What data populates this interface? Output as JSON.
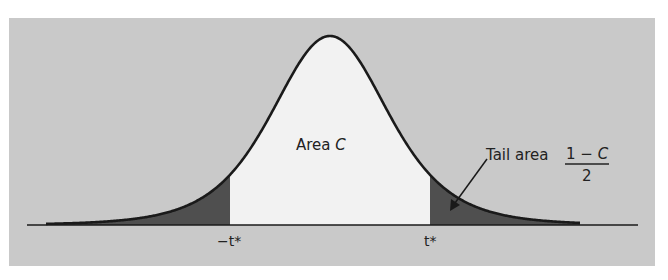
{
  "figure": {
    "panel_color": "#c9c9c9",
    "center_fill": "#f2f2f2",
    "tail_fill": "#4f4f4f",
    "curve_color": "#1a1a1a",
    "axis_color": "#1a1a1a"
  },
  "labels": {
    "area_c_prefix": "Area ",
    "area_c_var": "C",
    "tail_area": "Tail area",
    "fraction_numerator_prefix": "1 − ",
    "fraction_numerator_var": "C",
    "fraction_denominator": "2",
    "neg_t_star": "−t*",
    "pos_t_star": "t*"
  },
  "chart_data": {
    "type": "area",
    "title": "",
    "xlabel": "",
    "ylabel": "",
    "grid": false,
    "legend": null,
    "x_tick_labels": [
      "−t*",
      "t*"
    ],
    "annotations": [
      {
        "text": "Area C",
        "position": "center under curve"
      },
      {
        "text": "Tail area (1 − C)/2",
        "position": "right, arrow pointing into right shaded tail"
      }
    ],
    "regions": [
      {
        "name": "left tail",
        "from": "-inf",
        "to": "-t*",
        "shaded": true,
        "area": "(1 - C)/2"
      },
      {
        "name": "central area",
        "from": "-t*",
        "to": "t*",
        "shaded": false,
        "area": "C"
      },
      {
        "name": "right tail",
        "from": "t*",
        "to": "inf",
        "shaded": true,
        "area": "(1 - C)/2"
      }
    ],
    "geometry": {
      "center_px": 330,
      "baseline_y_px": 225,
      "peak_y_px": 36,
      "scale_px_per_unit": 60,
      "df": 5,
      "t_star_units": 1.667,
      "curve_x_range_px": [
        46,
        580
      ],
      "axis_x_range_px": [
        27,
        638
      ],
      "panel": {
        "x": 9,
        "y": 18,
        "w": 646,
        "h": 248
      }
    }
  }
}
